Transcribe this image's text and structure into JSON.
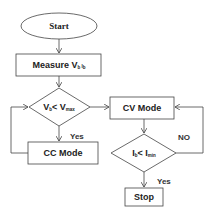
{
  "diagram": {
    "type": "flowchart",
    "nodes": {
      "start": {
        "shape": "ellipse",
        "label": "Start"
      },
      "measure": {
        "shape": "rect",
        "label": "Measure V",
        "sub1": "b",
        "mid": " I",
        "sub2": "b"
      },
      "decision1": {
        "shape": "diamond",
        "label_a": "V",
        "sub_a": "b",
        "op": "< V",
        "sub_b": "max"
      },
      "cc_mode": {
        "shape": "rect",
        "label": "CC Mode"
      },
      "cv_mode": {
        "shape": "rect",
        "label": "CV Mode"
      },
      "decision2": {
        "shape": "diamond",
        "label_a": "I",
        "sub_a": "b",
        "op": "< I",
        "sub_b": "min"
      },
      "stop": {
        "shape": "rect",
        "label": "Stop"
      }
    },
    "edges": [
      {
        "from": "start",
        "to": "measure",
        "label": ""
      },
      {
        "from": "measure",
        "to": "decision1",
        "label": ""
      },
      {
        "from": "decision1",
        "to": "cc_mode",
        "label": "Yes"
      },
      {
        "from": "cc_mode",
        "to": "decision1",
        "label": ""
      },
      {
        "from": "decision1",
        "to": "cv_mode",
        "label": ""
      },
      {
        "from": "cv_mode",
        "to": "decision2",
        "label": ""
      },
      {
        "from": "decision2",
        "to": "cv_mode",
        "label": "NO"
      },
      {
        "from": "decision2",
        "to": "stop",
        "label": "Yes"
      }
    ],
    "edge_labels": {
      "yes1": "Yes",
      "no": "NO",
      "yes2": "Yes"
    }
  }
}
